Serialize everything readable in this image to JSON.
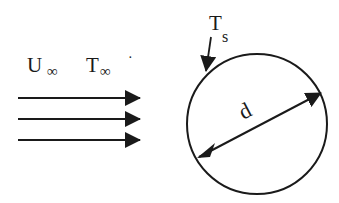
{
  "diagram": {
    "type": "cylinder-in-crossflow",
    "free_stream": {
      "velocity_label": "U",
      "velocity_subscript": "∞",
      "temperature_label": "T",
      "temperature_subscript": "∞",
      "trailing_mark": "·",
      "arrow_count": 3
    },
    "cylinder": {
      "surface_temperature_label": "T",
      "surface_temperature_subscript": "s",
      "diameter_label": "d"
    },
    "colors": {
      "ink": "#1a1a1a",
      "background": "#ffffff"
    }
  }
}
